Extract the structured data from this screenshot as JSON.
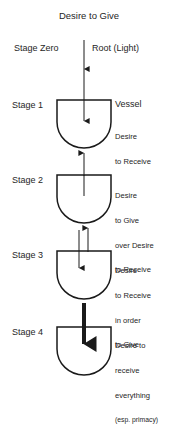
{
  "diagram": {
    "title": "Desire to Give",
    "headers": {
      "left": "Stage Zero",
      "right": "Root (Light)"
    },
    "vessel_label": "Vessel",
    "stages": [
      {
        "label": "Stage 1",
        "description_lines": [
          "Desire",
          "to Receive"
        ],
        "note": ""
      },
      {
        "label": "Stage 2",
        "description_lines": [
          "Desire",
          "to Give",
          "over Desire",
          "to Receive"
        ],
        "note": ""
      },
      {
        "label": "Stage 3",
        "description_lines": [
          "Desire",
          "to Receive",
          "in order",
          "to Give"
        ],
        "note": ""
      },
      {
        "label": "Stage 4",
        "description_lines": [
          "Desire to",
          "receive",
          "everything"
        ],
        "note": "(esp. primacy)"
      }
    ],
    "colors": {
      "stroke": "#1a1a1a",
      "text": "#262626",
      "background": "#ffffff"
    }
  }
}
